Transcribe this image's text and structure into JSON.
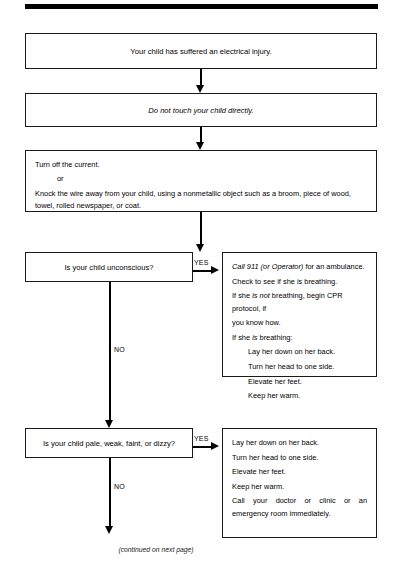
{
  "page": {
    "footer_note": "(continued on next page)"
  },
  "flowchart": {
    "type": "flowchart",
    "nodes": [
      {
        "id": "statement-1",
        "kind": "statement",
        "text": "Your child has suffered an electrical injury."
      },
      {
        "id": "statement-2",
        "kind": "statement",
        "text_before": "Do ",
        "text_emphasis": "not",
        "text_after": " touch your child directly."
      },
      {
        "id": "statement-3",
        "kind": "statement",
        "lines": [
          "Turn off the current.",
          "or",
          "Knock the wire away from your child, using a nonmetallic object such as a broom, piece of wood, towel, rolled newspaper, or coat."
        ]
      },
      {
        "id": "decision-1",
        "kind": "decision",
        "text": "Is your child unconscious?",
        "yes_label": "YES",
        "no_label": "NO"
      },
      {
        "id": "action-1",
        "kind": "action",
        "lines": [
          "Call 911 (or Operator) for an ambulance.",
          "Check to see if she is breathing.",
          "If she is not breathing, begin CPR protocol, if you know how.",
          "If she is breathing:",
          "Lay her down on her back.",
          "Turn her head to one side.",
          "Elevate her feet.",
          "Keep her warm."
        ]
      },
      {
        "id": "decision-2",
        "kind": "decision",
        "text": "Is your child pale, weak, faint, or dizzy?",
        "yes_label": "YES",
        "no_label": "NO"
      },
      {
        "id": "action-2",
        "kind": "action",
        "lines": [
          "Lay her down on her back.",
          "Turn her head to one side.",
          "Elevate her feet.",
          "Keep her warm.",
          "Call your doctor or clinic or an emergency room immediately."
        ]
      }
    ]
  },
  "action1_lines": {
    "l1_a": "Call 911 (or Operator)",
    "l1_b": " for an ambulance.",
    "l2": "Check to see if she is breathing.",
    "l3_a": "If she ",
    "l3_b": "is not",
    "l3_c": " breathing, begin CPR protocol, if",
    "l4": "you know how.",
    "l5_a": "If she ",
    "l5_b": "is",
    "l5_c": " breathing:",
    "l6": "Lay her down on her back.",
    "l7": "Turn her head to one side.",
    "l8": "Elevate her feet.",
    "l9": "Keep her warm."
  },
  "action2_lines": {
    "l1": "Lay her down on her back.",
    "l2": "Turn her head to one side.",
    "l3": "Elevate her feet.",
    "l4": "Keep her warm.",
    "l5": "Call your doctor or clinic or an emergency room immediately."
  },
  "statement3_lines": {
    "l1": "Turn off the current.",
    "l2": "or",
    "l3": "Knock the wire away from your child, using a nonmetallic object such as a broom, piece of wood, towel, rolled newspaper, or coat."
  },
  "statement2_parts": {
    "before": "Do ",
    "emphasis": "not",
    "after": " touch your child directly."
  },
  "labels": {
    "yes_1": "YES",
    "yes_2": "YES",
    "no_1": "NO",
    "no_2": "NO"
  },
  "colors": {
    "ink": "#000000",
    "border": "#1a1a1a",
    "background": "#ffffff"
  }
}
